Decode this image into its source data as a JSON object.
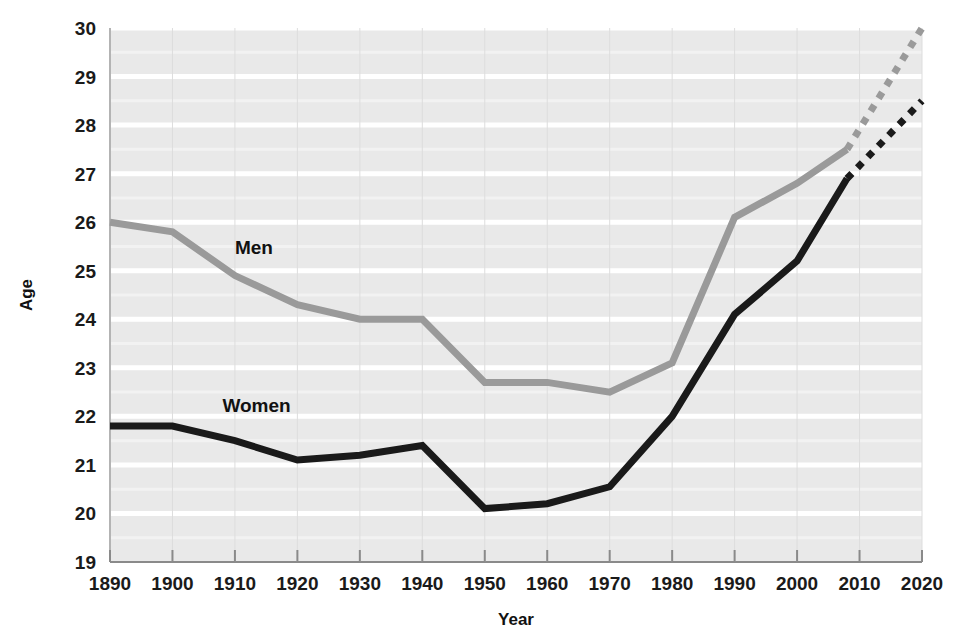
{
  "chart_data": {
    "type": "line",
    "title": "",
    "xlabel": "Year",
    "ylabel": "Age",
    "xlim": [
      1890,
      2020
    ],
    "ylim": [
      19,
      30
    ],
    "grid": true,
    "grid_orientation": "horizontal",
    "legend_position": "inline-annotation",
    "x_tick_labels": [
      "1890",
      "1900",
      "1910",
      "1920",
      "1930",
      "1940",
      "1950",
      "1960",
      "1970",
      "1980",
      "1990",
      "2000",
      "2010",
      "2020"
    ],
    "y_tick_labels": [
      "19",
      "20",
      "21",
      "22",
      "23",
      "24",
      "25",
      "26",
      "27",
      "28",
      "29",
      "30"
    ],
    "x_ticks": [
      1890,
      1900,
      1910,
      1920,
      1930,
      1940,
      1950,
      1960,
      1970,
      1980,
      1990,
      2000,
      2010,
      2020
    ],
    "y_ticks": [
      19,
      20,
      21,
      22,
      23,
      24,
      25,
      26,
      27,
      28,
      29,
      30
    ],
    "series": [
      {
        "name": "Men",
        "color": "#9a9a9a",
        "label_text": "Men",
        "label_x": 1910,
        "label_y": 25.35,
        "solid": {
          "x": [
            1890,
            1900,
            1910,
            1920,
            1930,
            1940,
            1950,
            1960,
            1970,
            1980,
            1990,
            2000,
            2008
          ],
          "y": [
            26.0,
            25.8,
            24.9,
            24.3,
            24.0,
            24.0,
            22.7,
            22.7,
            22.5,
            23.1,
            26.1,
            26.8,
            27.5
          ]
        },
        "projected": {
          "x": [
            2008,
            2020
          ],
          "y": [
            27.5,
            30.0
          ],
          "style": "dotted"
        }
      },
      {
        "name": "Women",
        "color": "#1a1a1a",
        "label_text": "Women",
        "label_x": 1908,
        "label_y": 22.1,
        "solid": {
          "x": [
            1890,
            1900,
            1910,
            1920,
            1930,
            1940,
            1950,
            1960,
            1970,
            1980,
            1990,
            2000,
            2008
          ],
          "y": [
            21.8,
            21.8,
            21.5,
            21.1,
            21.2,
            21.4,
            20.1,
            20.2,
            20.55,
            22.0,
            24.1,
            25.2,
            26.9
          ]
        },
        "projected": {
          "x": [
            2008,
            2020
          ],
          "y": [
            26.9,
            28.5
          ],
          "style": "dotted"
        }
      }
    ],
    "colors": {
      "plot_background": "#e9e9e9",
      "gridline": "#ffffff",
      "axis": "#8a8a8a",
      "men_series": "#9a9a9a",
      "women_series": "#1a1a1a",
      "text": "#111111"
    }
  },
  "axes": {
    "y_title": "Age",
    "x_title": "Year"
  }
}
